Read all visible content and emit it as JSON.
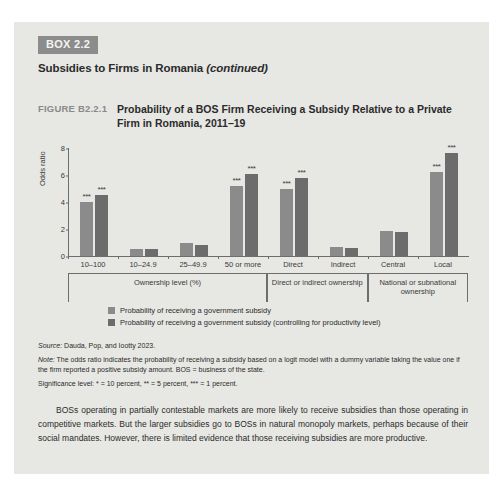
{
  "box": {
    "tag": "BOX 2.2",
    "title_main": "Subsidies to Firms in Romania",
    "title_continued": "(continued)"
  },
  "figure": {
    "label": "FIGURE B2.2.1",
    "title": "Probability of a BOS Firm Receiving a Subsidy Relative to a Private Firm in Romania, 2011–19"
  },
  "legend": {
    "series1": "Probability of receiving a government subsidy",
    "series2": "Probability of receiving a government subsidy (controlling for productivity level)"
  },
  "notes": {
    "source_label": "Source:",
    "source_text": " Dauda, Pop, and Iootty 2023.",
    "note_label": "Note:",
    "note_text": " The odds ratio indicates the probability of receiving a subsidy based on a logit model with a dummy variable taking the value one if the firm reported a positive subsidy amount. BOS = business of the state.",
    "significance": "Significance level: * = 10 percent, ** = 5 percent, *** = 1 percent."
  },
  "body": {
    "paragraph": "BOSs operating in partially contestable markets are more likely to receive subsidies than those operating in competitive markets. But the larger subsidies go to BOSs in natural monopoly markets, perhaps because of their social mandates. However, there is limited evidence that those receiving subsidies are more productive."
  },
  "colors": {
    "panel_background": "#e7e7e4",
    "tag_background": "#8c8c8c",
    "series1": "#8b8b8b",
    "series2": "#6c6c6c",
    "axis": "#6d6d6d",
    "text": "#2b2b2b"
  },
  "chart_data": {
    "type": "bar",
    "title": "Probability of a BOS Firm Receiving a Subsidy Relative to a Private Firm in Romania, 2011–19",
    "xlabel": "",
    "ylabel": "Odds ratio",
    "ylim": [
      0,
      8
    ],
    "yticks": [
      0,
      2,
      4,
      6,
      8
    ],
    "grid": false,
    "legend_position": "bottom-left",
    "categories": [
      "10–100",
      "10–24.9",
      "25–49.9",
      "50 or more",
      "Direct",
      "Indirect",
      "Central",
      "Local"
    ],
    "group_labels": [
      "Ownership level (%)",
      "Direct or indirect ownership",
      "National or subnational ownership"
    ],
    "group_spans": [
      4,
      2,
      2
    ],
    "series": [
      {
        "name": "Probability of receiving a government subsidy",
        "values": [
          4.0,
          0.5,
          1.0,
          5.2,
          5.0,
          0.7,
          1.85,
          6.2
        ],
        "significance": [
          "***",
          "",
          "",
          "***",
          "***",
          "",
          "",
          "***"
        ]
      },
      {
        "name": "Probability of receiving a government subsidy (controlling for productivity level)",
        "values": [
          4.5,
          0.5,
          0.8,
          6.1,
          5.8,
          0.6,
          1.8,
          7.6
        ],
        "significance": [
          "***",
          "",
          "",
          "***",
          "***",
          "",
          "",
          "***"
        ]
      }
    ]
  }
}
